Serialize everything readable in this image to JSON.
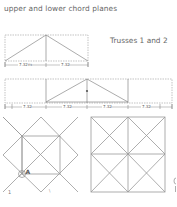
{
  "caption": "upper and lower chord planes",
  "truss_label": "Trusses 1 and 2",
  "truss1": {
    "dimensions": [
      "7.32m",
      "7.32"
    ]
  },
  "truss2": {
    "dimensions": [
      "7.32",
      "7.32",
      "7.32",
      "7.32"
    ]
  },
  "plan_left": {
    "node_label": "A",
    "marks": [
      "1",
      "\\"
    ]
  },
  "colors": {
    "line": "#8a8a8a",
    "dashed": "#a0a0a0",
    "text": "#666666"
  }
}
